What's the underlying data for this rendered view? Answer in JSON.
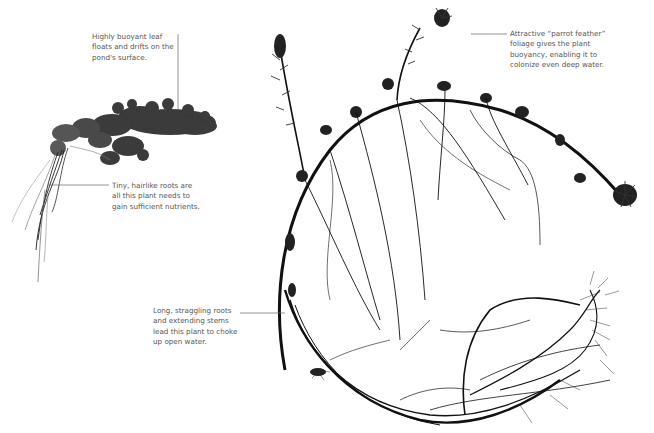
{
  "figure": {
    "subjects": [
      {
        "id": "left-plant",
        "description": "floating leafy aquatic plant with tiny hairlike roots"
      },
      {
        "id": "right-plant",
        "description": "parrot feather plant with arching stem and long straggling roots"
      }
    ],
    "annotations": [
      {
        "id": "leaf",
        "text": "Highly buoyant leaf\nfloats and drifts on the\npond's surface."
      },
      {
        "id": "feather",
        "text": "Attractive “parrot feather”\nfoliage gives the plant\nbuoyancy, enabling it to\ncolonize even deep water."
      },
      {
        "id": "roots-tiny",
        "text": "Tiny, hairlike roots are\nall this plant needs to\ngain sufficient nutrients."
      },
      {
        "id": "roots-long",
        "text": "Long, straggling roots\nand extending stems\nlead this plant to choke\nup open water."
      }
    ],
    "colors": {
      "background": "#ffffff",
      "ink": "#111111",
      "leaf": "#3a3a3a",
      "label_text": "#555555",
      "leader_line": "#666666"
    }
  }
}
